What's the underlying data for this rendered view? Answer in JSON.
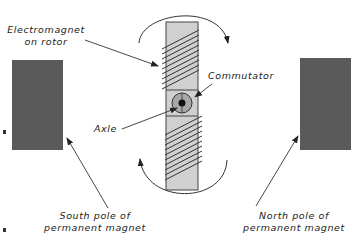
{
  "diagram": {
    "type": "DC motor schematic",
    "labels": {
      "electromagnet_line1": "Electromagnet",
      "electromagnet_line2": "on rotor",
      "commutator": "Commutator",
      "axle": "Axle",
      "south_line1": "South pole of",
      "south_line2": "permanent magnet",
      "north_line1": "North pole of",
      "north_line2": "permanent magnet"
    },
    "colors": {
      "magnet": "#5a5a5a",
      "rotor": "#d0d0d0",
      "commutator_outer": "#a8a8a8",
      "axle": "#111111",
      "line": "#333333"
    },
    "rotation_arrows": [
      "top-clockwise",
      "bottom-clockwise"
    ]
  }
}
